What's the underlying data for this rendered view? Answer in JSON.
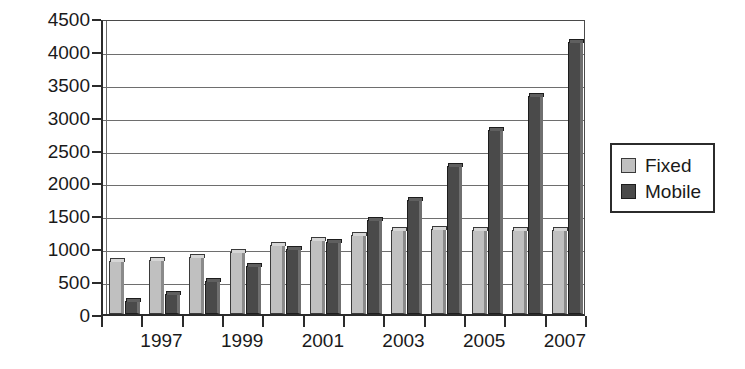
{
  "chart_data": {
    "type": "bar",
    "title": "",
    "subtitle": "",
    "xlabel": "",
    "ylabel": "",
    "categories": [
      "1996",
      "1997",
      "1998",
      "1999",
      "2000",
      "2001",
      "2002",
      "2003",
      "2004",
      "2005",
      "2006",
      "2007"
    ],
    "x_tick_labels": [
      "",
      "1997",
      "",
      "1999",
      "",
      "2001",
      "",
      "2003",
      "",
      "2005",
      "",
      "2007"
    ],
    "series": [
      {
        "name": "Fixed",
        "color": "#c0c0c0",
        "values": [
          800,
          820,
          870,
          950,
          1050,
          1120,
          1200,
          1270,
          1290,
          1280,
          1275,
          1280
        ]
      },
      {
        "name": "Mobile",
        "color": "#4a4a4a",
        "values": [
          200,
          300,
          500,
          730,
          990,
          1090,
          1430,
          1730,
          2250,
          2790,
          3320,
          4130
        ]
      }
    ],
    "ylim": [
      0,
      4500
    ],
    "y_ticks": [
      0,
      500,
      1000,
      1500,
      2000,
      2500,
      3000,
      3500,
      4000,
      4500
    ],
    "y_tick_labels": [
      "0",
      "500",
      "1000",
      "1500",
      "2000",
      "2500",
      "3000",
      "3500",
      "4000",
      "4500"
    ],
    "grid": true,
    "grid_axis": "y",
    "legend_position": "right",
    "legend_entries": [
      "Fixed",
      "Mobile"
    ]
  },
  "legend": {
    "items": [
      {
        "label": "Fixed",
        "swatch": "fixed-swatch-icon"
      },
      {
        "label": "Mobile",
        "swatch": "mobile-swatch-icon"
      }
    ]
  },
  "colors": {
    "fixed": "#c0c0c0",
    "mobile": "#4a4a4a",
    "axis": "#2b2b2b",
    "grid": "#6e6e6e",
    "background": "#ffffff",
    "text": "#1a1a1a"
  }
}
